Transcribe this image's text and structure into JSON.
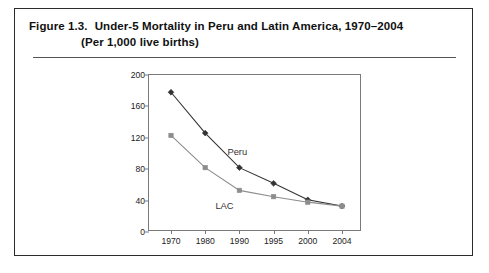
{
  "figure": {
    "label": "Figure 1.3.",
    "title": "Under-5 Mortality in Peru and Latin America, 1970–2004",
    "subtitle": "(Per 1,000 live births)"
  },
  "chart_data": {
    "type": "line",
    "title": "Under-5 Mortality in Peru and Latin America, 1970–2004",
    "subtitle": "(Per 1,000 live births)",
    "xlabel": "",
    "ylabel": "",
    "categories": [
      "1970",
      "1980",
      "1990",
      "1995",
      "2000",
      "2004"
    ],
    "series": [
      {
        "name": "Peru",
        "values": [
          178,
          126,
          82,
          62,
          41,
          33
        ],
        "color": "#333333",
        "marker": "diamond",
        "label_x": "1990",
        "label_text": "Peru"
      },
      {
        "name": "LAC",
        "values": [
          123,
          82,
          53,
          45,
          38,
          33
        ],
        "color": "#8c8c8c",
        "marker": "square",
        "label_x": "1990",
        "label_text": "LAC"
      }
    ],
    "ylim": [
      0,
      200
    ],
    "yticks": [
      0,
      40,
      80,
      120,
      160,
      200
    ],
    "ytick_labels": [
      "0",
      "40",
      "80",
      "120",
      "160",
      "200"
    ],
    "grid": false,
    "legend": "inline-annotations",
    "annotations": [
      {
        "text": "Peru",
        "series": "Peru"
      },
      {
        "text": "LAC",
        "series": "LAC"
      }
    ]
  },
  "colors": {
    "frame": "#2b2b2b",
    "axis": "#7a7a7a",
    "peru": "#333333",
    "lac": "#8c8c8c",
    "text": "#111111"
  }
}
